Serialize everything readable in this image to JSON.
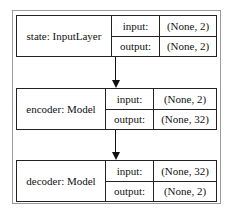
{
  "diagram": {
    "nodes": [
      {
        "id": "state",
        "name": "state: InputLayer",
        "input_label": "input:",
        "input_value": "(None, 2)",
        "output_label": "output:",
        "output_value": "(None, 2)"
      },
      {
        "id": "encoder",
        "name": "encoder: Model",
        "input_label": "input:",
        "input_value": "(None, 2)",
        "output_label": "output:",
        "output_value": "(None, 32)"
      },
      {
        "id": "decoder",
        "name": "decoder: Model",
        "input_label": "input:",
        "input_value": "(None, 32)",
        "output_label": "output:",
        "output_value": "(None, 2)"
      }
    ],
    "edges": [
      {
        "from": "state",
        "to": "encoder"
      },
      {
        "from": "encoder",
        "to": "decoder"
      }
    ]
  }
}
